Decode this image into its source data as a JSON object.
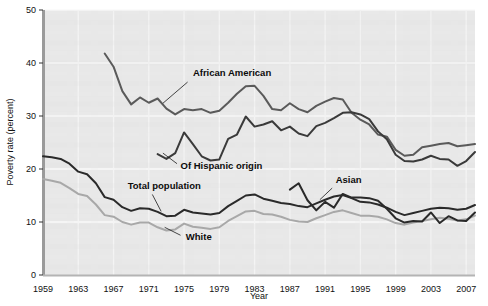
{
  "chart_data": {
    "type": "line",
    "title": "",
    "xlabel": "Year",
    "ylabel": "Poverty rate (percent)",
    "xlim": [
      1959,
      2008
    ],
    "ylim": [
      0,
      50
    ],
    "yticks": [
      0,
      10,
      20,
      30,
      40,
      50
    ],
    "ytick_labels": [
      "0",
      "10",
      "20",
      "30",
      "40",
      "50"
    ],
    "xticks": [
      1959,
      1963,
      1967,
      1971,
      1975,
      1979,
      1983,
      1987,
      1991,
      1995,
      1999,
      2003,
      2007
    ],
    "xtick_labels": [
      "1959",
      "1963",
      "1967",
      "1971",
      "1975",
      "1979",
      "1983",
      "1987",
      "1991",
      "1995",
      "1999",
      "2003",
      "2007"
    ],
    "grid": true,
    "legend": "inline-annotations",
    "plot_background": "#e8e8e8",
    "series": [
      {
        "name": "African American",
        "color": "#5a5a5a",
        "width": 2.0,
        "label_x": 1976,
        "label_y": 37.6,
        "leader_from": [
          1975.4,
          36.4
        ],
        "leader_to": [
          1972.6,
          32.4
        ],
        "label_anchor": "start",
        "x": [
          1966,
          1967,
          1968,
          1969,
          1970,
          1971,
          1972,
          1973,
          1974,
          1975,
          1976,
          1977,
          1978,
          1979,
          1980,
          1981,
          1982,
          1983,
          1984,
          1985,
          1986,
          1987,
          1988,
          1989,
          1990,
          1991,
          1992,
          1993,
          1994,
          1995,
          1996,
          1997,
          1998,
          1999,
          2000,
          2001,
          2002,
          2003,
          2004,
          2005,
          2006,
          2007,
          2008
        ],
        "values": [
          41.8,
          39.3,
          34.7,
          32.2,
          33.5,
          32.5,
          33.3,
          31.4,
          30.3,
          31.3,
          31.1,
          31.3,
          30.6,
          31.0,
          32.5,
          34.2,
          35.6,
          35.7,
          33.8,
          31.3,
          31.1,
          32.4,
          31.3,
          30.7,
          31.9,
          32.7,
          33.4,
          33.1,
          30.6,
          29.3,
          28.4,
          26.5,
          26.1,
          23.6,
          22.5,
          22.7,
          24.1,
          24.4,
          24.7,
          24.9,
          24.3,
          24.5,
          24.7
        ]
      },
      {
        "name": "Of Hispanic origin",
        "color": "#3a3a3a",
        "width": 2.0,
        "label_x": 1974.6,
        "label_y": 20.0,
        "leader_from": [
          1974.2,
          21.0
        ],
        "leader_to": [
          1972.6,
          23.0
        ],
        "label_anchor": "start",
        "x": [
          1972,
          1973,
          1974,
          1975,
          1976,
          1977,
          1978,
          1979,
          1980,
          1981,
          1982,
          1983,
          1984,
          1985,
          1986,
          1987,
          1988,
          1989,
          1990,
          1991,
          1992,
          1993,
          1994,
          1995,
          1996,
          1997,
          1998,
          1999,
          2000,
          2001,
          2002,
          2003,
          2004,
          2005,
          2006,
          2007,
          2008
        ],
        "values": [
          22.8,
          21.9,
          23.0,
          26.9,
          24.7,
          22.4,
          21.6,
          21.8,
          25.7,
          26.5,
          29.9,
          28.0,
          28.4,
          29.0,
          27.3,
          28.0,
          26.7,
          26.2,
          28.1,
          28.7,
          29.6,
          30.6,
          30.7,
          30.3,
          29.4,
          27.1,
          25.6,
          22.7,
          21.5,
          21.4,
          21.8,
          22.5,
          21.9,
          21.8,
          20.6,
          21.5,
          23.2
        ]
      },
      {
        "name": "Total population",
        "color": "#2a2a2a",
        "width": 2.0,
        "label_x": 1968.6,
        "label_y": 16.3,
        "leader_from": [
          1971.4,
          15.2
        ],
        "leader_to": [
          1972.4,
          12.0
        ],
        "label_anchor": "start",
        "x": [
          1959,
          1960,
          1961,
          1962,
          1963,
          1964,
          1965,
          1966,
          1967,
          1968,
          1969,
          1970,
          1971,
          1972,
          1973,
          1974,
          1975,
          1976,
          1977,
          1978,
          1979,
          1980,
          1981,
          1982,
          1983,
          1984,
          1985,
          1986,
          1987,
          1988,
          1989,
          1990,
          1991,
          1992,
          1993,
          1994,
          1995,
          1996,
          1997,
          1998,
          1999,
          2000,
          2001,
          2002,
          2003,
          2004,
          2005,
          2006,
          2007,
          2008
        ],
        "values": [
          22.4,
          22.2,
          21.9,
          21.0,
          19.5,
          19.0,
          17.3,
          14.7,
          14.2,
          12.8,
          12.1,
          12.6,
          12.5,
          11.9,
          11.1,
          11.2,
          12.3,
          11.8,
          11.6,
          11.4,
          11.7,
          13.0,
          14.0,
          15.0,
          15.2,
          14.4,
          14.0,
          13.6,
          13.4,
          13.0,
          12.8,
          13.5,
          14.2,
          14.8,
          15.1,
          14.5,
          13.8,
          13.7,
          13.3,
          12.7,
          11.9,
          11.3,
          11.7,
          12.1,
          12.5,
          12.7,
          12.6,
          12.3,
          12.5,
          13.2
        ]
      },
      {
        "name": "White",
        "color": "#a8a8a8",
        "width": 2.0,
        "label_x": 1975.2,
        "label_y": 6.6,
        "leader_from": [
          1974.6,
          7.5
        ],
        "leader_to": [
          1972.8,
          9.0
        ],
        "label_anchor": "start",
        "x": [
          1959,
          1960,
          1961,
          1962,
          1963,
          1964,
          1965,
          1966,
          1967,
          1968,
          1969,
          1970,
          1971,
          1972,
          1973,
          1974,
          1975,
          1976,
          1977,
          1978,
          1979,
          1980,
          1981,
          1982,
          1983,
          1984,
          1985,
          1986,
          1987,
          1988,
          1989,
          1990,
          1991,
          1992,
          1993,
          1994,
          1995,
          1996,
          1997,
          1998,
          1999,
          2000,
          2001,
          2002,
          2003,
          2004,
          2005,
          2006,
          2007,
          2008
        ],
        "values": [
          18.1,
          17.8,
          17.4,
          16.4,
          15.3,
          14.9,
          13.3,
          11.3,
          11.0,
          10.0,
          9.5,
          9.9,
          9.9,
          9.0,
          8.4,
          8.6,
          9.7,
          9.1,
          8.9,
          8.7,
          9.0,
          10.2,
          11.1,
          12.0,
          12.1,
          11.5,
          11.4,
          11.0,
          10.4,
          10.1,
          10.0,
          10.7,
          11.3,
          11.9,
          12.2,
          11.7,
          11.2,
          11.2,
          11.0,
          10.5,
          9.8,
          9.5,
          9.9,
          10.2,
          10.5,
          10.8,
          10.6,
          10.3,
          10.5,
          11.2
        ]
      },
      {
        "name": "Asian",
        "color": "#2a2a2a",
        "width": 2.0,
        "label_x": 1992.2,
        "label_y": 17.3,
        "leader_from": [
          1991.8,
          16.4
        ],
        "leader_to": [
          1990.4,
          14.2
        ],
        "label_anchor": "start",
        "x": [
          1987,
          1988,
          1989,
          1990,
          1991,
          1992,
          1993,
          1994,
          1995,
          1996,
          1997,
          1998,
          1999,
          2000,
          2001,
          2002,
          2003,
          2004,
          2005,
          2006,
          2007,
          2008
        ],
        "values": [
          16.1,
          17.3,
          14.1,
          12.2,
          13.8,
          12.7,
          15.3,
          14.6,
          14.6,
          14.5,
          14.0,
          12.5,
          10.7,
          9.9,
          10.2,
          10.1,
          11.8,
          9.8,
          11.1,
          10.3,
          10.2,
          11.8
        ]
      }
    ]
  },
  "axes": {
    "x_axis_title": "Year",
    "y_axis_title": "Poverty rate (percent)"
  }
}
